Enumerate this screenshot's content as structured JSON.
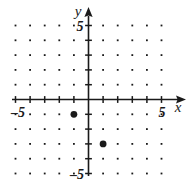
{
  "figure": {
    "kind": "coordinate-plane",
    "background_color": "#ffffff",
    "ink_color": "#1a1a1a"
  },
  "axes": {
    "x_axis_label": "x",
    "y_axis_label": "y",
    "x_tick_label_positive": "5",
    "x_tick_label_negative": "–5",
    "y_tick_label_positive": "5",
    "y_tick_label_negative": "–5"
  },
  "chart_data": {
    "type": "scatter",
    "title": "",
    "xlabel": "x",
    "ylabel": "y",
    "xlim": [
      -5,
      5
    ],
    "ylim": [
      -5,
      5
    ],
    "xticks": [
      -5,
      -4,
      -3,
      -2,
      -1,
      0,
      1,
      2,
      3,
      4,
      5
    ],
    "yticks": [
      -5,
      -4,
      -3,
      -2,
      -1,
      0,
      1,
      2,
      3,
      4,
      5
    ],
    "xtick_labels_shown": [
      "-5",
      "5"
    ],
    "ytick_labels_shown": [
      "-5",
      "5"
    ],
    "grid": true,
    "grid_style": "dots at integer lattice points",
    "legend": "none",
    "points": [
      {
        "x": -1,
        "y": -1,
        "label": "",
        "marker": "filled-circle"
      },
      {
        "x": 1,
        "y": -3,
        "label": "",
        "marker": "filled-circle"
      }
    ]
  }
}
